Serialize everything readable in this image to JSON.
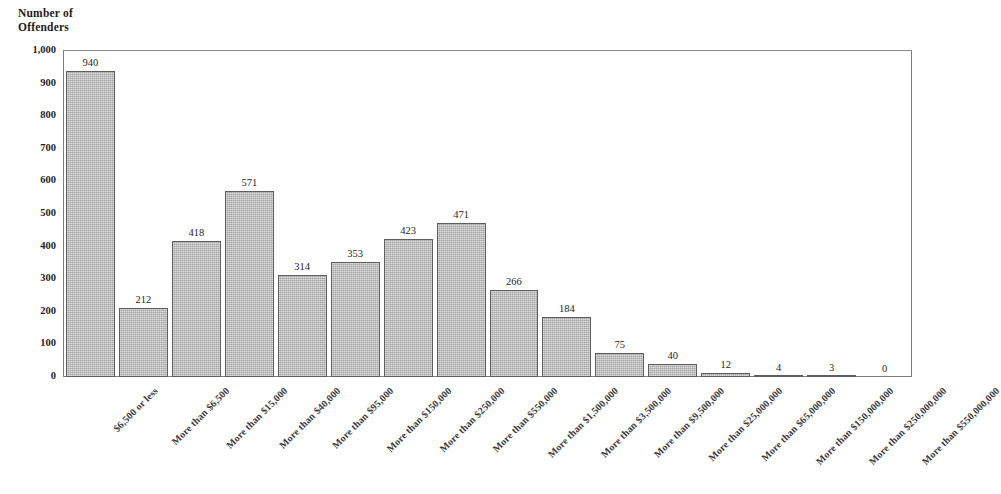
{
  "chart_data": {
    "type": "bar",
    "title": "",
    "ylabel": "Number of\nOffenders",
    "xlabel": "",
    "ylim": [
      0,
      1000
    ],
    "y_ticks": [
      "0",
      "100",
      "200",
      "300",
      "400",
      "500",
      "600",
      "700",
      "800",
      "900",
      "1,000"
    ],
    "y_tick_values": [
      0,
      100,
      200,
      300,
      400,
      500,
      600,
      700,
      800,
      900,
      1000
    ],
    "grid": false,
    "legend": "none",
    "bar_color": "#b9b9b9",
    "bar_border_color": "#5e5e5e",
    "categories": [
      "$6,500 or less",
      "More than $6,500",
      "More than $15,000",
      "More than $40,000",
      "More than $95,000",
      "More than $150,000",
      "More than $250,000",
      "More than $550,000",
      "More than $1,500,000",
      "More than $3,500,000",
      "More than $9,500,000",
      "More than $25,000,000",
      "More than $65,000,000",
      "More than $150,000,000",
      "More than $250,000,000",
      "More than $550,000,000"
    ],
    "values": [
      940,
      212,
      418,
      571,
      314,
      353,
      423,
      471,
      266,
      184,
      75,
      40,
      12,
      4,
      3,
      0
    ],
    "value_labels": [
      "940",
      "212",
      "418",
      "571",
      "314",
      "353",
      "423",
      "471",
      "266",
      "184",
      "75",
      "40",
      "12",
      "4",
      "3",
      "0"
    ]
  }
}
